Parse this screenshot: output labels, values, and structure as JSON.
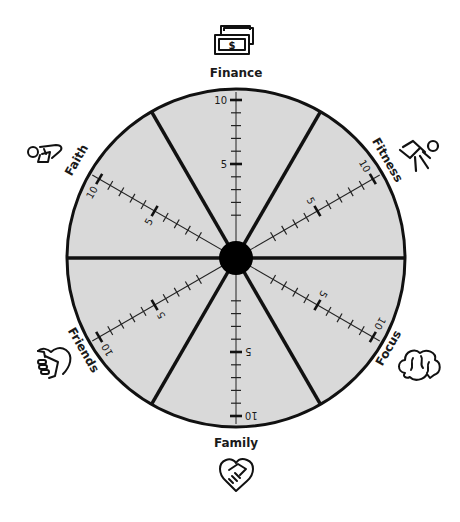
{
  "diagram": {
    "type": "life-balance-wheel",
    "scale": {
      "min": 0,
      "max": 10,
      "labeled_ticks": [
        "5",
        "10"
      ]
    },
    "colors": {
      "wheel_fill": "#d9d9d9",
      "stroke": "#111111",
      "center_dot": "#000000",
      "background": "#ffffff"
    },
    "categories": [
      {
        "label": "Finance",
        "icon": "money-bills-icon",
        "angle": 90
      },
      {
        "label": "Fitness",
        "icon": "running-person-icon",
        "angle": 30
      },
      {
        "label": "Focus",
        "icon": "brain-icon",
        "angle": -30
      },
      {
        "label": "Family",
        "icon": "heart-handshake-icon",
        "angle": -90
      },
      {
        "label": "Friends",
        "icon": "fist-bump-heart-icon",
        "angle": -150
      },
      {
        "label": "Faith",
        "icon": "kneeling-prayer-icon",
        "angle": 150
      }
    ]
  }
}
